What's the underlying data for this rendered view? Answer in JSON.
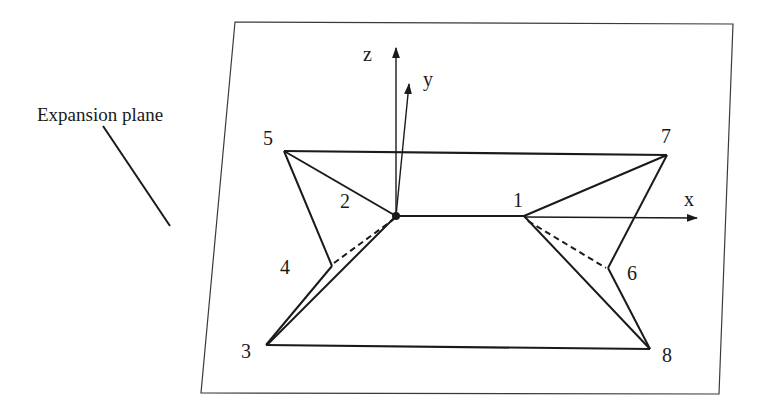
{
  "figure": {
    "plane_label": "Expansion plane",
    "axes": {
      "x": "x",
      "y": "y",
      "z": "z"
    },
    "vertices": [
      {
        "id": "1",
        "label": "1"
      },
      {
        "id": "2",
        "label": "2"
      },
      {
        "id": "3",
        "label": "3"
      },
      {
        "id": "4",
        "label": "4"
      },
      {
        "id": "5",
        "label": "5"
      },
      {
        "id": "6",
        "label": "6"
      },
      {
        "id": "7",
        "label": "7"
      },
      {
        "id": "8",
        "label": "8"
      }
    ],
    "colors": {
      "line": "#1a1a1a",
      "plane_border": "#3a3a3a",
      "background": "#ffffff"
    }
  }
}
